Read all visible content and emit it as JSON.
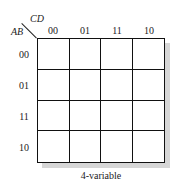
{
  "kmap": {
    "type": "4-variable",
    "col_var": "CD",
    "row_var": "AB",
    "col_labels": [
      "00",
      "01",
      "11",
      "10"
    ],
    "row_labels": [
      "00",
      "01",
      "11",
      "10"
    ],
    "cells": [
      [
        "",
        "",
        "",
        ""
      ],
      [
        "",
        "",
        "",
        ""
      ],
      [
        "",
        "",
        "",
        ""
      ],
      [
        "",
        "",
        "",
        ""
      ]
    ],
    "caption": "4-variable"
  }
}
